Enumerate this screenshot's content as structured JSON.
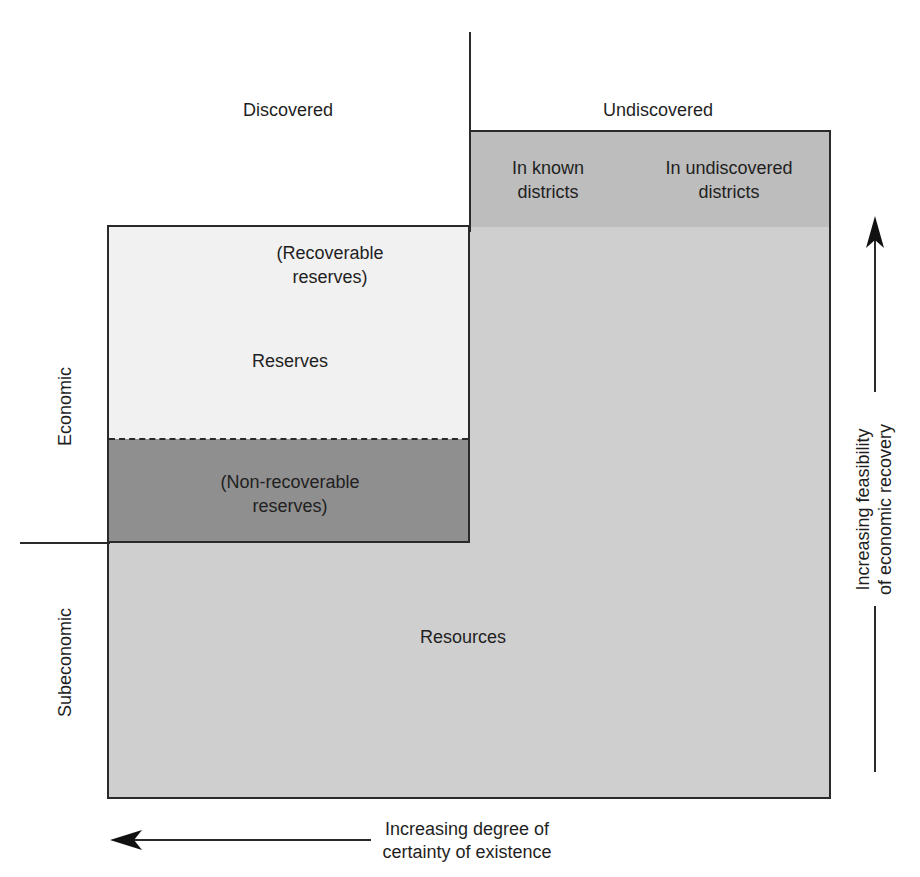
{
  "diagram": {
    "columns": {
      "discovered": "Discovered",
      "undiscovered": "Undiscovered",
      "in_known_districts_line1": "In known",
      "in_known_districts_line2": "districts",
      "in_undiscovered_districts_line1": "In undiscovered",
      "in_undiscovered_districts_line2": "districts"
    },
    "rows": {
      "economic": "Economic",
      "subeconomic": "Subeconomic"
    },
    "regions": {
      "recoverable_line1": "(Recoverable",
      "recoverable_line2": "reserves)",
      "reserves": "Reserves",
      "nonrecoverable_line1": "(Non-recoverable",
      "nonrecoverable_line2": "reserves)",
      "resources": "Resources"
    },
    "axes": {
      "horizontal_line1": "Increasing degree of",
      "horizontal_line2": "certainty of existence",
      "vertical_line1": "Increasing feasibility",
      "vertical_line2": "of economic recovery"
    },
    "colors": {
      "resources_fill": "#cfcfcf",
      "reserves_fill": "#f1f1f1",
      "nonrecoverable_fill": "#8f8f8f",
      "undiscovered_header_fill": "#bdbdbd",
      "line": "#2a2a2a"
    }
  }
}
